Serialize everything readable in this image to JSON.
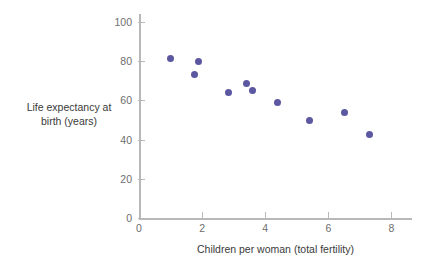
{
  "chart_data": {
    "type": "scatter",
    "title": "",
    "xlabel": "Children per woman (total fertility)",
    "ylabel_line1": "Life expectancy at",
    "ylabel_line2": "birth (years)",
    "xlim": [
      0,
      8.65
    ],
    "ylim": [
      0,
      104
    ],
    "xticks": [
      0,
      2,
      4,
      6,
      8
    ],
    "xtick_labels": [
      "0",
      "2",
      "4",
      "6",
      "8"
    ],
    "yticks": [
      0,
      20,
      40,
      60,
      80,
      100
    ],
    "ytick_labels": [
      "0",
      "20",
      "40",
      "60",
      "80",
      "100"
    ],
    "grid": false,
    "legend": "none",
    "marker_color": "#5b57a0",
    "axis_color": "#b8b8b8",
    "points": [
      {
        "x": 1.0,
        "y": 81.5
      },
      {
        "x": 1.75,
        "y": 73.0
      },
      {
        "x": 1.9,
        "y": 79.8
      },
      {
        "x": 2.85,
        "y": 63.8
      },
      {
        "x": 3.4,
        "y": 68.8
      },
      {
        "x": 3.6,
        "y": 64.8
      },
      {
        "x": 4.4,
        "y": 58.8
      },
      {
        "x": 5.4,
        "y": 49.8
      },
      {
        "x": 6.5,
        "y": 53.8
      },
      {
        "x": 7.3,
        "y": 42.5
      }
    ]
  }
}
